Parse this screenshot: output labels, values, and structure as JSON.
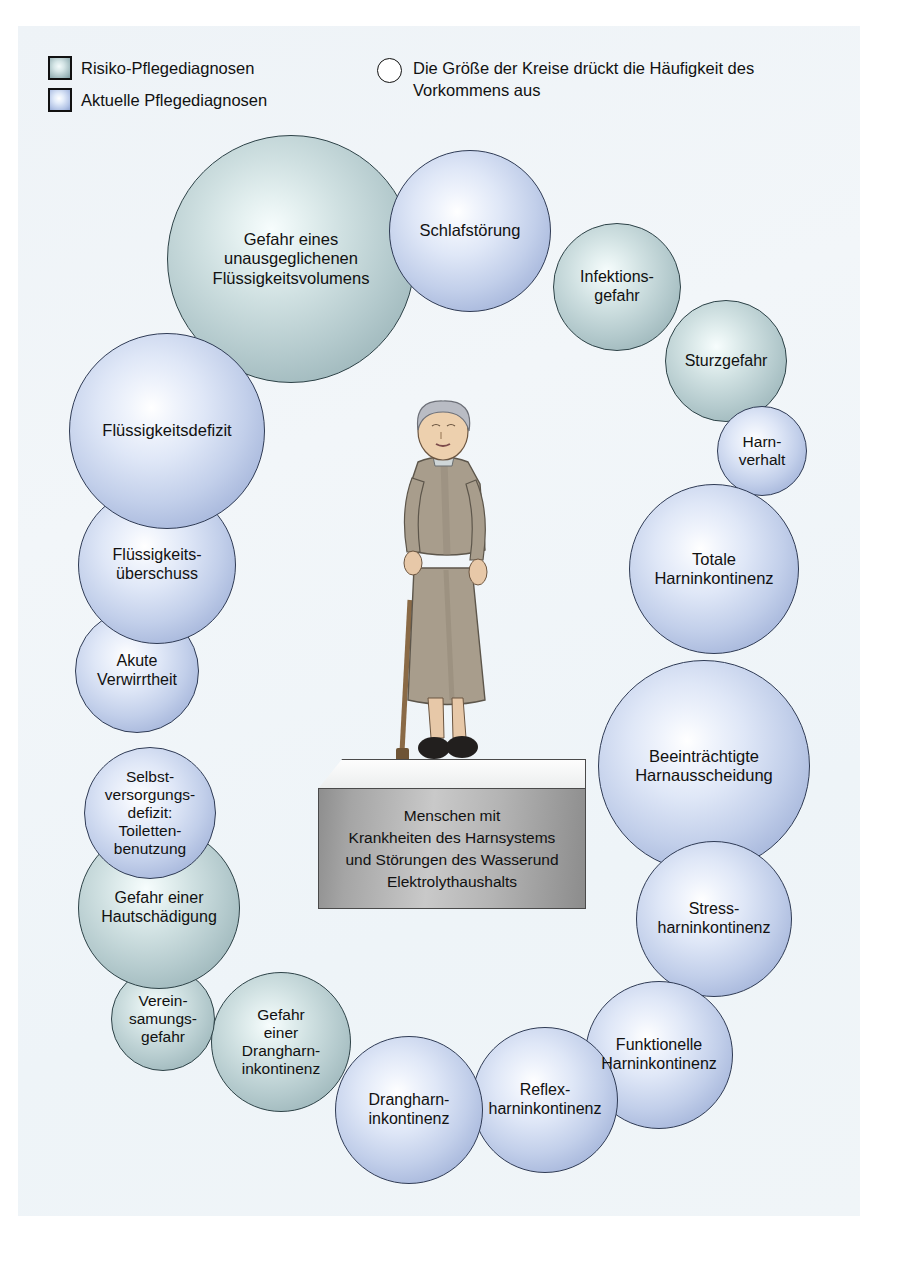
{
  "legend": {
    "risk_label": "Risiko-Pflegediagnosen",
    "actual_label": "Aktuelle Pflegediagnosen",
    "size_note_line1": "Die Größe der Kreise drückt die Häufigkeit des",
    "size_note_line2": "Vorkommens aus"
  },
  "center": {
    "text": "Menschen mit\nKrankheiten des Harnsystems\nund Störungen des Wasserund\nElektrolythaushalts",
    "person_alt": "elderly-woman-with-cane"
  },
  "colors": {
    "risk_fill": "#a8c0c4",
    "actual_fill": "#b3c4e6",
    "panel_background": "#eef3f7",
    "pedestal_face": "#b4b4b4",
    "outline": "#2f3b55",
    "text": "#111111"
  },
  "chart_data": {
    "type": "bubble",
    "title": "",
    "legend_position": "top",
    "categories": [
      "Risiko-Pflegediagnosen",
      "Aktuelle Pflegediagnosen"
    ],
    "note": "Die Größe der Kreise drückt die Häufigkeit des Vorkommens aus",
    "bubbles": [
      {
        "label": "Gefahr eines\nunausgeglichenen\nFlüssigkeitsvolumens",
        "kind": "risk",
        "cx": 291,
        "cy": 259,
        "r": 124,
        "font": 16.5
      },
      {
        "label": "Schlafstörung",
        "kind": "actual",
        "cx": 470,
        "cy": 231,
        "r": 81,
        "font": 16.5
      },
      {
        "label": "Infektions-\ngefahr",
        "kind": "risk",
        "cx": 617,
        "cy": 287,
        "r": 64,
        "font": 16.0
      },
      {
        "label": "Sturzgefahr",
        "kind": "risk",
        "cx": 726,
        "cy": 361,
        "r": 61,
        "font": 16.0
      },
      {
        "label": "Harn-\nverhalt",
        "kind": "actual",
        "cx": 762,
        "cy": 451,
        "r": 45,
        "font": 15.5
      },
      {
        "label": "Totale\nHarninkontinenz",
        "kind": "actual",
        "cx": 714,
        "cy": 569,
        "r": 85,
        "font": 16.5
      },
      {
        "label": "Beeinträchtigte\nHarnausscheidung",
        "kind": "actual",
        "cx": 704,
        "cy": 766,
        "r": 106,
        "font": 16.5
      },
      {
        "label": "Stress-\nharninkontinenz",
        "kind": "actual",
        "cx": 714,
        "cy": 919,
        "r": 78,
        "font": 16.0
      },
      {
        "label": "Funktionelle\nHarninkontinenz",
        "kind": "actual",
        "cx": 659,
        "cy": 1055,
        "r": 74,
        "font": 16.0
      },
      {
        "label": "Reflex-\nharninkontinenz",
        "kind": "actual",
        "cx": 545,
        "cy": 1100,
        "r": 73,
        "font": 16.0
      },
      {
        "label": "Drangharn-\ninkontinenz",
        "kind": "actual",
        "cx": 409,
        "cy": 1110,
        "r": 74,
        "font": 16.0
      },
      {
        "label": "Gefahr\neiner\nDrangharn-\ninkontinenz",
        "kind": "risk",
        "cx": 281,
        "cy": 1042,
        "r": 70,
        "font": 15.5
      },
      {
        "label": "Verein-\nsamungs-\ngefahr",
        "kind": "risk",
        "cx": 163,
        "cy": 1019,
        "r": 52,
        "font": 15.5
      },
      {
        "label": "Gefahr einer\nHautschädigung",
        "kind": "risk",
        "cx": 159,
        "cy": 908,
        "r": 81,
        "font": 16.0
      },
      {
        "label": "Selbst-\nversorgungs-\ndefizit:\nToiletten-\nbenutzung",
        "kind": "actual",
        "cx": 150,
        "cy": 813,
        "r": 66,
        "font": 15.5
      },
      {
        "label": "Akute\nVerwirrtheit",
        "kind": "actual",
        "cx": 137,
        "cy": 671,
        "r": 62,
        "font": 16.0
      },
      {
        "label": "Flüssigkeits-\nüberschuss",
        "kind": "actual",
        "cx": 157,
        "cy": 565,
        "r": 79,
        "font": 16.0
      },
      {
        "label": "Flüssigkeitsdefizit",
        "kind": "actual",
        "cx": 167,
        "cy": 431,
        "r": 98,
        "font": 16.5
      }
    ]
  }
}
